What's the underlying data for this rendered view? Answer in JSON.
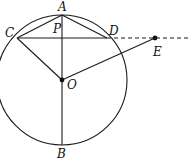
{
  "figure": {
    "type": "geometry-diagram",
    "colors": {
      "stroke": "#1a1a1a",
      "background": "#ffffff"
    },
    "circle": {
      "center_label": "O",
      "cx": 62,
      "cy": 80,
      "r": 65
    },
    "points": {
      "A": {
        "label": "A",
        "x": 62,
        "y": 15
      },
      "B": {
        "label": "B",
        "x": 62,
        "y": 145
      },
      "C": {
        "label": "C",
        "x": 17,
        "y": 38
      },
      "D": {
        "label": "D",
        "x": 107,
        "y": 38
      },
      "E": {
        "label": "E",
        "x": 155,
        "y": 38
      },
      "O": {
        "label": "O",
        "x": 62,
        "y": 80
      },
      "P": {
        "label": "P",
        "x": 62,
        "y": 38
      }
    },
    "segments": [
      "AB",
      "CD",
      "AC",
      "AD",
      "CO",
      "OE"
    ],
    "dashed": [
      "DE-extended"
    ]
  }
}
